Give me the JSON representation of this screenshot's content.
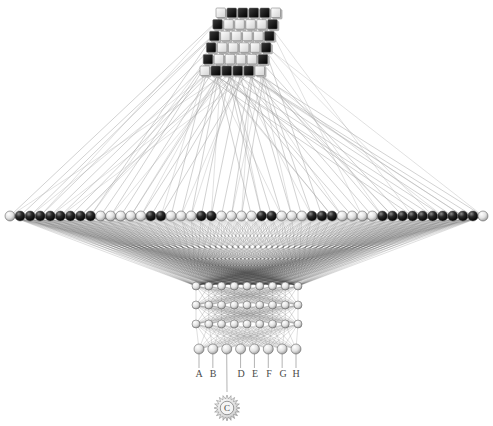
{
  "diagram": {
    "background_color": "#ffffff",
    "line_color": "#888888",
    "node_dark_color": "#111111",
    "node_light_color": "#e8e8e8",
    "node_edge_color": "#555555"
  },
  "input_grid": {
    "name": "input-pixel-grid",
    "rows": 6,
    "cols": 6,
    "cell_size": 11,
    "origin_x": 200,
    "origin_y": 8,
    "skew_x": 3.2,
    "skew_y": 2.2,
    "filled": [
      [
        0,
        1,
        1,
        1,
        1,
        0
      ],
      [
        1,
        0,
        0,
        0,
        0,
        1
      ],
      [
        1,
        0,
        0,
        0,
        0,
        1
      ],
      [
        1,
        0,
        0,
        0,
        0,
        1
      ],
      [
        1,
        0,
        0,
        0,
        0,
        1
      ],
      [
        0,
        1,
        1,
        1,
        1,
        0
      ]
    ]
  },
  "wide_layer": {
    "name": "wide-feature-layer",
    "count": 48,
    "x_start": 10,
    "x_end": 483,
    "y": 216,
    "radius": 5,
    "dark_indices": [
      1,
      2,
      3,
      4,
      5,
      6,
      7,
      8,
      14,
      15,
      19,
      20,
      25,
      26,
      30,
      31,
      32,
      37,
      38,
      39,
      40,
      41,
      42,
      43,
      44,
      45,
      46
    ]
  },
  "hidden_block": {
    "name": "hidden-dense-block",
    "layers": [
      {
        "count": 9,
        "y": 286,
        "x_start": 196,
        "x_end": 298,
        "radius": 4
      },
      {
        "count": 9,
        "y": 305,
        "x_start": 196,
        "x_end": 298,
        "radius": 4
      },
      {
        "count": 9,
        "y": 324,
        "x_start": 196,
        "x_end": 298,
        "radius": 4
      }
    ]
  },
  "output_layer": {
    "name": "output-layer",
    "count": 8,
    "x_start": 199,
    "x_end": 296,
    "y": 349,
    "radius": 5
  },
  "output_labels": [
    {
      "text": "A",
      "x": 199,
      "y": 376
    },
    {
      "text": "B",
      "x": 213,
      "y": 376
    },
    {
      "text": "D",
      "x": 241,
      "y": 376
    },
    {
      "text": "E",
      "x": 255,
      "y": 376
    },
    {
      "text": "F",
      "x": 269,
      "y": 376
    },
    {
      "text": "G",
      "x": 283,
      "y": 376
    },
    {
      "text": "H",
      "x": 296,
      "y": 376
    }
  ],
  "selected_output": {
    "name": "selected-output-gear",
    "letter": "C",
    "x": 227,
    "y": 408,
    "radius": 13,
    "teeth": 20
  }
}
